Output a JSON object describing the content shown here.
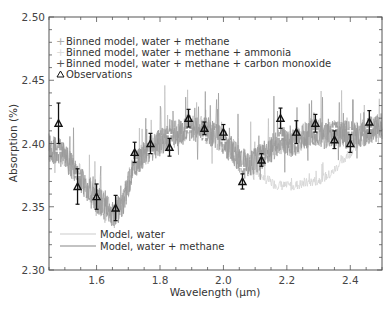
{
  "chart_data": {
    "type": "line",
    "title": "",
    "xlabel": "Wavelength (μm)",
    "ylabel": "Absorption (%)",
    "xlim": [
      1.45,
      2.5
    ],
    "ylim": [
      2.3,
      2.5
    ],
    "x_ticks": [
      1.6,
      1.8,
      2.0,
      2.2,
      2.4
    ],
    "x_tick_labels": [
      "1.6",
      "1.8",
      "2.0",
      "2.2",
      "2.4"
    ],
    "y_ticks": [
      2.3,
      2.35,
      2.4,
      2.45,
      2.5
    ],
    "y_tick_labels": [
      "2.30",
      "2.35",
      "2.40",
      "2.45",
      "2.50"
    ],
    "grid": false,
    "legend_top": [
      {
        "marker": "cross-gray",
        "label": "Binned model, water + methane"
      },
      {
        "marker": "cross-light",
        "label": "Binned model, water + methane + ammonia"
      },
      {
        "marker": "cross-dark",
        "label": "Binned model, water + methane + carbon monoxide"
      },
      {
        "marker": "triangle",
        "label": "Observations"
      }
    ],
    "legend_bottom": [
      {
        "line": "light-gray",
        "label": "Model, water"
      },
      {
        "line": "gray",
        "label": "Model, water + methane"
      }
    ],
    "observations": {
      "x": [
        1.48,
        1.54,
        1.6,
        1.66,
        1.72,
        1.77,
        1.83,
        1.89,
        1.94,
        2.0,
        2.06,
        2.12,
        2.18,
        2.23,
        2.29,
        2.35,
        2.4,
        2.46
      ],
      "y": [
        2.416,
        2.366,
        2.358,
        2.349,
        2.393,
        2.4,
        2.397,
        2.42,
        2.412,
        2.409,
        2.37,
        2.387,
        2.42,
        2.409,
        2.416,
        2.403,
        2.4,
        2.417
      ],
      "err": [
        0.016,
        0.014,
        0.01,
        0.01,
        0.008,
        0.008,
        0.007,
        0.007,
        0.005,
        0.006,
        0.006,
        0.005,
        0.008,
        0.009,
        0.007,
        0.007,
        0.007,
        0.009
      ]
    },
    "binned_model": {
      "x": [
        1.48,
        1.54,
        1.6,
        1.66,
        1.72,
        1.77,
        1.83,
        1.89,
        1.94,
        2.0,
        2.06,
        2.12,
        2.18,
        2.23,
        2.29,
        2.35,
        2.4,
        2.46
      ],
      "y": [
        2.394,
        2.375,
        2.358,
        2.361,
        2.387,
        2.393,
        2.407,
        2.411,
        2.405,
        2.402,
        2.381,
        2.39,
        2.405,
        2.4,
        2.41,
        2.412,
        2.41,
        2.412
      ]
    },
    "model_water_methane": {
      "x": [
        1.45,
        1.5,
        1.55,
        1.6,
        1.65,
        1.68,
        1.72,
        1.78,
        1.85,
        1.9,
        1.95,
        2.0,
        2.05,
        2.08,
        2.12,
        2.18,
        2.22,
        2.28,
        2.32,
        2.36,
        2.42,
        2.5
      ],
      "y": [
        2.398,
        2.39,
        2.372,
        2.356,
        2.345,
        2.35,
        2.385,
        2.398,
        2.408,
        2.412,
        2.41,
        2.402,
        2.388,
        2.382,
        2.39,
        2.402,
        2.4,
        2.41,
        2.406,
        2.408,
        2.406,
        2.414
      ]
    },
    "model_water": {
      "x": [
        2.08,
        2.12,
        2.16,
        2.2,
        2.25,
        2.3,
        2.34,
        2.37,
        2.42,
        2.5
      ],
      "y": [
        2.382,
        2.374,
        2.368,
        2.366,
        2.368,
        2.371,
        2.376,
        2.385,
        2.398,
        2.41
      ]
    }
  }
}
